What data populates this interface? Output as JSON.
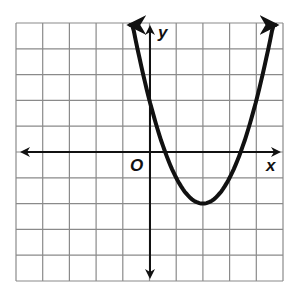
{
  "chart_data": {
    "type": "line",
    "title": "",
    "xlabel": "x",
    "ylabel": "y",
    "origin_label": "O",
    "xlim": [
      -5,
      5
    ],
    "ylim": [
      -5,
      5
    ],
    "grid": true,
    "grid_step": 1,
    "tick_labels": false,
    "series": [
      {
        "name": "parabola",
        "equation": "y = (x - 2)^2 - 2",
        "vertex": [
          2,
          -2
        ],
        "y_intercept": [
          0,
          2
        ],
        "x_intercepts": [
          0.59,
          3.41
        ],
        "x": [
          -0.75,
          -0.5,
          0,
          0.5,
          1,
          1.5,
          2,
          2.5,
          3,
          3.5,
          4,
          4.5,
          4.75
        ],
        "y": [
          5.56,
          4.25,
          2,
          0.25,
          -1,
          -1.75,
          -2,
          -1.75,
          -1,
          0.25,
          2,
          4.25,
          5.56
        ],
        "arrows_both_ends": true
      }
    ],
    "colors": {
      "curve": "#111111",
      "grid": "#8a8a8a",
      "background": "#ffffff"
    }
  },
  "labels": {
    "x_axis": "x",
    "y_axis": "y",
    "origin": "O"
  }
}
